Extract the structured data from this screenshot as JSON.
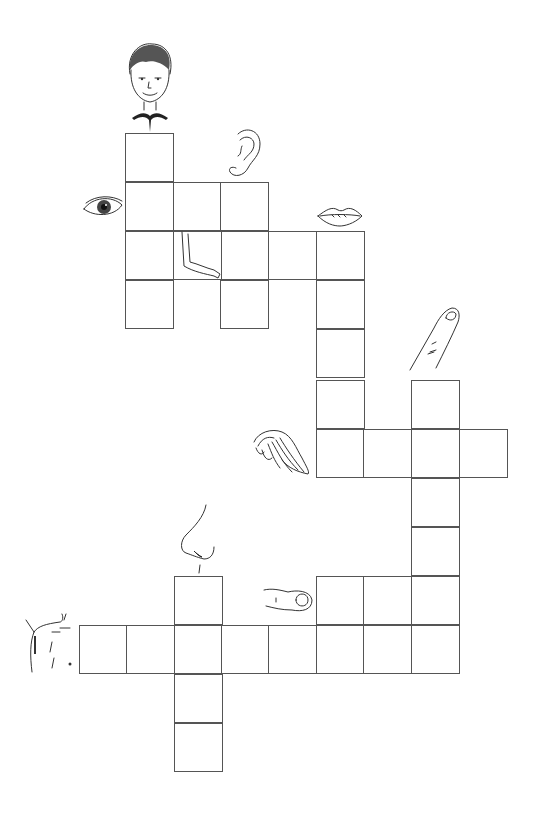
{
  "puzzle": {
    "type": "picture-crossword",
    "theme": "body parts",
    "cell_size": 48,
    "border_color": "#555555",
    "background": "#ffffff"
  },
  "clues": [
    {
      "id": "head",
      "icon": "head-icon",
      "direction": "down",
      "length": 4,
      "start": {
        "x": 125,
        "y": 133
      }
    },
    {
      "id": "eye",
      "icon": "eye-icon",
      "direction": "across",
      "length": 3,
      "start": {
        "x": 125,
        "y": 182
      }
    },
    {
      "id": "ear",
      "icon": "ear-icon",
      "direction": "down",
      "length": 3,
      "start": {
        "x": 220,
        "y": 182
      }
    },
    {
      "id": "arm",
      "icon": "arm-icon",
      "direction": "across",
      "length": 5,
      "start": {
        "x": 125,
        "y": 231
      }
    },
    {
      "id": "mouth",
      "icon": "mouth-icon",
      "direction": "down",
      "length": 5,
      "start": {
        "x": 316,
        "y": 231
      }
    },
    {
      "id": "finger",
      "icon": "finger-icon",
      "direction": "down",
      "length": 6,
      "start": {
        "x": 411,
        "y": 380
      }
    },
    {
      "id": "hair",
      "icon": "hair-icon",
      "direction": "across",
      "length": 4,
      "start": {
        "x": 316,
        "y": 429
      }
    },
    {
      "id": "nose",
      "icon": "nose-icon",
      "direction": "down",
      "length": 4,
      "start": {
        "x": 174,
        "y": 576
      }
    },
    {
      "id": "thumb",
      "icon": "thumb-icon",
      "direction": "across",
      "length": 3,
      "start": {
        "x": 316,
        "y": 576
      }
    },
    {
      "id": "shoulder",
      "icon": "shoulder-icon",
      "direction": "across",
      "length": 8,
      "start": {
        "x": 79,
        "y": 625
      }
    }
  ],
  "cells": [
    [
      125,
      133
    ],
    [
      125,
      182
    ],
    [
      125,
      231
    ],
    [
      125,
      280
    ],
    [
      173,
      182
    ],
    [
      220,
      182
    ],
    [
      220,
      231
    ],
    [
      220,
      280
    ],
    [
      173,
      231
    ],
    [
      268,
      231
    ],
    [
      316,
      231
    ],
    [
      316,
      280
    ],
    [
      316,
      329
    ],
    [
      316,
      380
    ],
    [
      316,
      429
    ],
    [
      363,
      429
    ],
    [
      411,
      429
    ],
    [
      459,
      429
    ],
    [
      411,
      380
    ],
    [
      411,
      478
    ],
    [
      411,
      527
    ],
    [
      411,
      576
    ],
    [
      411,
      625
    ],
    [
      316,
      576
    ],
    [
      363,
      576
    ],
    [
      79,
      625
    ],
    [
      126,
      625
    ],
    [
      174,
      625
    ],
    [
      221,
      625
    ],
    [
      268,
      625
    ],
    [
      316,
      625
    ],
    [
      363,
      625
    ],
    [
      174,
      576
    ],
    [
      174,
      674
    ],
    [
      174,
      723
    ]
  ]
}
